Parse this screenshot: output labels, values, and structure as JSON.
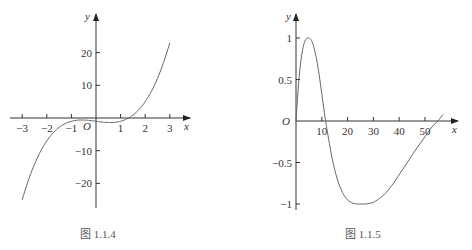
{
  "chart_data": [
    {
      "type": "line",
      "title": "",
      "caption": "图 1.1.4",
      "function": "y = x^3 - x - 1",
      "xlabel": "x",
      "ylabel": "y",
      "origin_label": "O",
      "xlim": [
        -3.5,
        3.5
      ],
      "ylim": [
        -27,
        27
      ],
      "grid": false,
      "x_ticks": [
        -3,
        -2,
        -1,
        1,
        2,
        3
      ],
      "x_tick_labels": [
        "−3",
        "−2",
        "−1",
        "1",
        "2",
        "3"
      ],
      "y_ticks": [
        20,
        10,
        -10,
        -20
      ],
      "y_tick_labels": [
        "20",
        "10",
        "−10",
        "−20"
      ],
      "series": [
        {
          "name": "curve",
          "x": [
            -3,
            -2.5,
            -2,
            -1.5,
            -1,
            -0.58,
            0,
            0.58,
            1,
            1.32,
            1.5,
            2,
            2.5,
            3
          ],
          "y": [
            -25,
            -14.1,
            -7,
            -2.9,
            -1,
            -0.62,
            -1,
            -1.38,
            -1,
            0,
            0.88,
            5,
            11.1,
            23
          ]
        }
      ]
    },
    {
      "type": "line",
      "title": "",
      "caption": "图 1.1.5",
      "xlabel": "x",
      "ylabel": "y",
      "origin_label": "O",
      "xlim": [
        0,
        60
      ],
      "ylim": [
        -1.1,
        1.1
      ],
      "grid": false,
      "x_ticks": [
        10,
        20,
        30,
        40,
        50
      ],
      "x_tick_labels": [
        "10",
        "20",
        "30",
        "40",
        "50"
      ],
      "y_ticks": [
        1,
        0.5,
        -0.5,
        -1
      ],
      "y_tick_labels": [
        "1",
        "0.5",
        "−0.5",
        "−1"
      ],
      "series": [
        {
          "name": "curve",
          "x": [
            0,
            1,
            2,
            3,
            4,
            5,
            6,
            7,
            8,
            9,
            10,
            11,
            12,
            14,
            16,
            18,
            20,
            22,
            24,
            26,
            27,
            28,
            30,
            32,
            35,
            38,
            41,
            44,
            47,
            50,
            53,
            55,
            57
          ],
          "y": [
            0,
            0.45,
            0.75,
            0.92,
            0.99,
            1.0,
            0.97,
            0.88,
            0.74,
            0.55,
            0.33,
            0.1,
            -0.1,
            -0.45,
            -0.7,
            -0.86,
            -0.95,
            -0.99,
            -1.0,
            -1.0,
            -1.0,
            -0.995,
            -0.98,
            -0.94,
            -0.86,
            -0.74,
            -0.6,
            -0.46,
            -0.32,
            -0.19,
            -0.06,
            0.0,
            0.08
          ]
        }
      ]
    }
  ]
}
